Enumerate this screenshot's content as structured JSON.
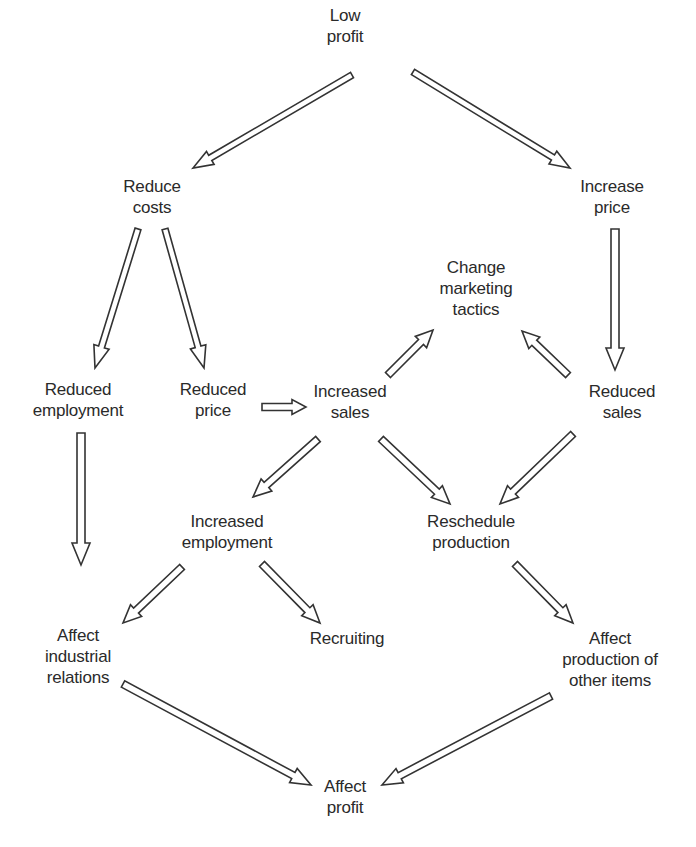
{
  "diagram": {
    "type": "cause-effect flow diagram",
    "nodes": [
      {
        "id": "low_profit",
        "lines": [
          "Low",
          "profit"
        ],
        "x": 345,
        "y": 5
      },
      {
        "id": "reduce_costs",
        "lines": [
          "Reduce",
          "costs"
        ],
        "x": 152,
        "y": 176
      },
      {
        "id": "increase_price",
        "lines": [
          "Increase",
          "price"
        ],
        "x": 612,
        "y": 176
      },
      {
        "id": "change_marketing_tactics",
        "lines": [
          "Change",
          "marketing",
          "tactics"
        ],
        "x": 476,
        "y": 257
      },
      {
        "id": "reduced_employment",
        "lines": [
          "Reduced",
          "employment"
        ],
        "x": 78,
        "y": 379
      },
      {
        "id": "reduced_price",
        "lines": [
          "Reduced",
          "price"
        ],
        "x": 213,
        "y": 379
      },
      {
        "id": "increased_sales",
        "lines": [
          "Increased",
          "sales"
        ],
        "x": 350,
        "y": 381
      },
      {
        "id": "reduced_sales",
        "lines": [
          "Reduced",
          "sales"
        ],
        "x": 622,
        "y": 381
      },
      {
        "id": "increased_employment",
        "lines": [
          "Increased",
          "employment"
        ],
        "x": 227,
        "y": 511
      },
      {
        "id": "reschedule_production",
        "lines": [
          "Reschedule",
          "production"
        ],
        "x": 471,
        "y": 511
      },
      {
        "id": "affect_industrial_relations",
        "lines": [
          "Affect",
          "industrial",
          "relations"
        ],
        "x": 78,
        "y": 625
      },
      {
        "id": "recruiting",
        "lines": [
          "Recruiting"
        ],
        "x": 347,
        "y": 628
      },
      {
        "id": "affect_production_other_items",
        "lines": [
          "Affect",
          "production of",
          "other items"
        ],
        "x": 610,
        "y": 628
      },
      {
        "id": "affect_profit",
        "lines": [
          "Affect",
          "profit"
        ],
        "x": 345,
        "y": 776
      }
    ],
    "edges": [
      {
        "from": "low_profit",
        "to": "reduce_costs",
        "tail": [
          352,
          75
        ],
        "tip": [
          193,
          168
        ],
        "shaft": 6,
        "head": 15,
        "headLen": 20
      },
      {
        "from": "low_profit",
        "to": "increase_price",
        "tail": [
          413,
          72
        ],
        "tip": [
          570,
          168
        ],
        "shaft": 6,
        "head": 15,
        "headLen": 20
      },
      {
        "from": "reduce_costs",
        "to": "reduced_employment",
        "tail": [
          138,
          229
        ],
        "tip": [
          95,
          368
        ],
        "shaft": 6,
        "head": 16,
        "headLen": 22
      },
      {
        "from": "reduce_costs",
        "to": "reduced_price",
        "tail": [
          165,
          229
        ],
        "tip": [
          204,
          368
        ],
        "shaft": 6,
        "head": 16,
        "headLen": 22
      },
      {
        "from": "reduced_price",
        "to": "increased_sales",
        "tail": [
          262,
          407
        ],
        "tip": [
          306,
          407
        ],
        "shaft": 7,
        "head": 15,
        "headLen": 14
      },
      {
        "from": "increased_sales",
        "to": "change_marketing_tactics",
        "tail": [
          388,
          375
        ],
        "tip": [
          433,
          330
        ],
        "shaft": 7,
        "head": 16,
        "headLen": 17
      },
      {
        "from": "reduced_sales",
        "to": "change_marketing_tactics",
        "tail": [
          568,
          375
        ],
        "tip": [
          522,
          331
        ],
        "shaft": 7,
        "head": 16,
        "headLen": 17
      },
      {
        "from": "increase_price",
        "to": "reduced_sales",
        "tail": [
          615,
          229
        ],
        "tip": [
          615,
          370
        ],
        "shaft": 8,
        "head": 18,
        "headLen": 22
      },
      {
        "from": "reduced_employment",
        "to": "affect_industrial_relations",
        "tail": [
          81,
          433
        ],
        "tip": [
          81,
          565
        ],
        "shaft": 8,
        "head": 18,
        "headLen": 22
      },
      {
        "from": "increased_sales",
        "to": "increased_employment",
        "tail": [
          318,
          439
        ],
        "tip": [
          253,
          497
        ],
        "shaft": 7,
        "head": 16,
        "headLen": 18
      },
      {
        "from": "increased_sales",
        "to": "reschedule_production",
        "tail": [
          381,
          439
        ],
        "tip": [
          450,
          504
        ],
        "shaft": 7,
        "head": 16,
        "headLen": 18
      },
      {
        "from": "reduced_sales",
        "to": "reschedule_production",
        "tail": [
          573,
          434
        ],
        "tip": [
          500,
          504
        ],
        "shaft": 7,
        "head": 16,
        "headLen": 18
      },
      {
        "from": "increased_employment",
        "to": "affect_industrial_relations",
        "tail": [
          182,
          567
        ],
        "tip": [
          123,
          623
        ],
        "shaft": 7,
        "head": 16,
        "headLen": 18
      },
      {
        "from": "increased_employment",
        "to": "recruiting",
        "tail": [
          262,
          564
        ],
        "tip": [
          320,
          623
        ],
        "shaft": 7,
        "head": 16,
        "headLen": 18
      },
      {
        "from": "reschedule_production",
        "to": "affect_production_other_items",
        "tail": [
          515,
          564
        ],
        "tip": [
          573,
          623
        ],
        "shaft": 7,
        "head": 16,
        "headLen": 18
      },
      {
        "from": "affect_industrial_relations",
        "to": "affect_profit",
        "tail": [
          123,
          684
        ],
        "tip": [
          311,
          785
        ],
        "shaft": 7,
        "head": 16,
        "headLen": 20
      },
      {
        "from": "affect_production_other_items",
        "to": "affect_profit",
        "tail": [
          551,
          696
        ],
        "tip": [
          382,
          785
        ],
        "shaft": 7,
        "head": 16,
        "headLen": 20
      }
    ]
  }
}
